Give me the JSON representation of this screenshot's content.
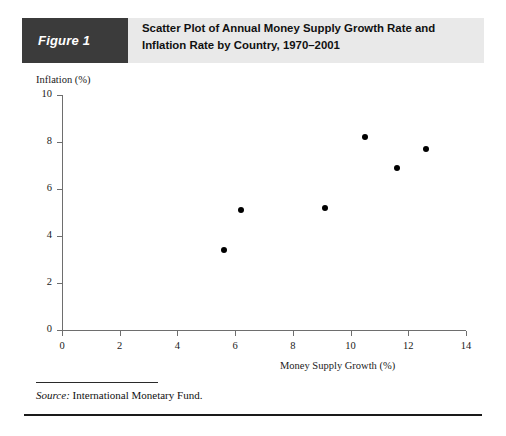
{
  "figure": {
    "tag": "Figure 1",
    "title_line1": "Scatter Plot of Annual Money Supply Growth Rate and",
    "title_line2": "Inflation Rate by Country, 1970–2001",
    "source_label": "Source:",
    "source_text": " International Monetary Fund.",
    "tag_background": "#3b3b3b",
    "band_background": "#e9e9e9"
  },
  "chart_data": {
    "type": "scatter",
    "title": "Scatter Plot of Annual Money Supply Growth Rate and Inflation Rate by Country, 1970–2001",
    "xlabel": "Money Supply Growth (%)",
    "ylabel": "Inflation (%)",
    "xlim": [
      0,
      14
    ],
    "ylim": [
      0,
      10
    ],
    "xticks": [
      0,
      2,
      4,
      6,
      8,
      10,
      12,
      14
    ],
    "yticks": [
      0,
      2,
      4,
      6,
      8,
      10
    ],
    "xtick_labels": [
      "0",
      "2",
      "4",
      "6",
      "8",
      "10",
      "12",
      "14"
    ],
    "ytick_labels": [
      "0",
      "2",
      "4",
      "6",
      "8",
      "10"
    ],
    "grid": false,
    "legend": false,
    "marker_color": "#000000",
    "points": [
      {
        "x": 5.6,
        "y": 3.4
      },
      {
        "x": 6.2,
        "y": 5.1
      },
      {
        "x": 9.1,
        "y": 5.2
      },
      {
        "x": 10.5,
        "y": 8.2
      },
      {
        "x": 11.6,
        "y": 6.9
      },
      {
        "x": 12.6,
        "y": 7.7
      }
    ]
  }
}
